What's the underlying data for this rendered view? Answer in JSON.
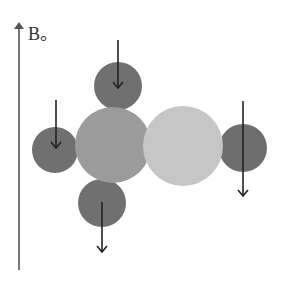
{
  "diagram": {
    "axis_label": "B。",
    "axis": {
      "x": 19,
      "y_top": 22,
      "y_bottom": 270,
      "color": "#555555"
    },
    "colors": {
      "small_atom": "#707070",
      "left_big_atom": "#9a9a9a",
      "right_big_atom": "#c4c4c4",
      "arrow": "#222222"
    },
    "atoms": [
      {
        "name": "top-small-atom",
        "cx": 118,
        "cy": 86,
        "r": 24,
        "fill": "#707070"
      },
      {
        "name": "left-small-atom",
        "cx": 55,
        "cy": 150,
        "r": 23,
        "fill": "#707070"
      },
      {
        "name": "bottom-small-atom",
        "cx": 102,
        "cy": 203,
        "r": 24,
        "fill": "#707070"
      },
      {
        "name": "right-small-atom",
        "cx": 243,
        "cy": 148,
        "r": 24,
        "fill": "#6e6e6e"
      },
      {
        "name": "left-big-atom",
        "cx": 113,
        "cy": 145,
        "r": 38,
        "fill": "#9b9b9b"
      },
      {
        "name": "right-big-atom",
        "cx": 183,
        "cy": 146,
        "r": 40,
        "fill": "#c6c6c6"
      }
    ],
    "arrows": [
      {
        "name": "top-spin-arrow",
        "x": 118,
        "y1": 40,
        "y2": 88,
        "direction": "down"
      },
      {
        "name": "left-spin-arrow",
        "x": 56,
        "y1": 100,
        "y2": 148,
        "direction": "down"
      },
      {
        "name": "right-spin-arrow",
        "x": 243,
        "y1": 101,
        "y2": 196,
        "direction": "down"
      },
      {
        "name": "bottom-spin-arrow",
        "x": 102,
        "y1": 202,
        "y2": 252,
        "direction": "down"
      }
    ]
  }
}
